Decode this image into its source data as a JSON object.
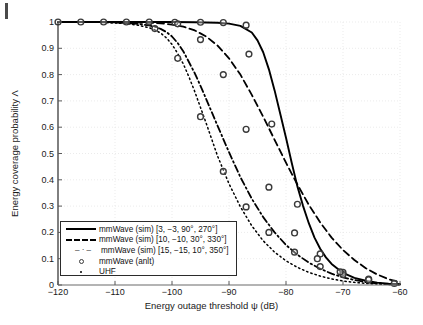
{
  "figure": {
    "background_color": "#ffffff",
    "artifact_note": "scan-mark"
  },
  "chart_data": {
    "type": "line",
    "title": "",
    "xlabel": "Energy outage threshold ψ (dB)",
    "ylabel": "Energy coverage probability Λ",
    "xlim": [
      -120,
      -60
    ],
    "ylim": [
      0,
      1
    ],
    "xticks": [
      -120,
      -110,
      -100,
      -90,
      -80,
      -70,
      -60
    ],
    "xticklabels": [
      "−120",
      "−110",
      "−100",
      "−90",
      "−80",
      "−70",
      "−60"
    ],
    "yticks": [
      0,
      0.1,
      0.2,
      0.3,
      0.4,
      0.5,
      0.6,
      0.7,
      0.8,
      0.9,
      1
    ],
    "yticklabels": [
      "0",
      "0.1",
      "0.2",
      "0.3",
      "0.4",
      "0.5",
      "0.6",
      "0.7",
      "0.8",
      "0.9",
      "1"
    ],
    "grid": true,
    "grid_style": "dotted",
    "grid_color": "#e6e6e6",
    "legend_position": "lower-left",
    "series": [
      {
        "name": "mmWave (sim) [3, −3, 90°, 270°]",
        "style": "solid",
        "color": "#000000",
        "x": [
          -120,
          -116,
          -112,
          -108,
          -104,
          -100,
          -96,
          -92,
          -90,
          -88,
          -86,
          -85,
          -84,
          -83,
          -82,
          -81,
          -80,
          -79,
          -78,
          -77,
          -76,
          -75,
          -74,
          -73,
          -72,
          -70,
          -68,
          -66,
          -64,
          -62,
          -60
        ],
        "y": [
          1,
          1,
          1,
          1,
          1,
          1,
          0.999,
          0.997,
          0.994,
          0.985,
          0.96,
          0.93,
          0.885,
          0.82,
          0.74,
          0.65,
          0.56,
          0.465,
          0.375,
          0.3,
          0.235,
          0.18,
          0.138,
          0.105,
          0.08,
          0.046,
          0.027,
          0.016,
          0.009,
          0.005,
          0.003
        ]
      },
      {
        "name": "mmWave (sim) [10, −10, 30°, 330°]",
        "style": "dashed",
        "color": "#000000",
        "x": [
          -120,
          -116,
          -112,
          -108,
          -104,
          -102,
          -100,
          -98,
          -96,
          -94,
          -92,
          -90,
          -88,
          -86,
          -84,
          -82,
          -80,
          -78,
          -76,
          -74,
          -72,
          -70,
          -68,
          -66,
          -64,
          -62,
          -60
        ],
        "y": [
          1,
          1,
          1,
          0.999,
          0.997,
          0.995,
          0.99,
          0.982,
          0.968,
          0.945,
          0.91,
          0.862,
          0.8,
          0.723,
          0.64,
          0.552,
          0.465,
          0.382,
          0.305,
          0.238,
          0.18,
          0.133,
          0.095,
          0.064,
          0.04,
          0.022,
          0.01
        ]
      },
      {
        "name": "mmWave (sim) [15, −15, 10°, 350°]",
        "style": "dash-dot",
        "color": "#000000",
        "x": [
          -120,
          -116,
          -112,
          -108,
          -106,
          -104,
          -103,
          -102,
          -101,
          -100,
          -99,
          -98,
          -96,
          -95,
          -94,
          -92,
          -91,
          -90,
          -88,
          -86,
          -84,
          -82,
          -80,
          -78,
          -76,
          -74,
          -72,
          -70,
          -68,
          -66,
          -64,
          -62,
          -60
        ],
        "y": [
          1,
          1,
          0.999,
          0.996,
          0.993,
          0.987,
          0.982,
          0.974,
          0.962,
          0.945,
          0.92,
          0.888,
          0.805,
          0.757,
          0.707,
          0.605,
          0.555,
          0.505,
          0.41,
          0.328,
          0.258,
          0.2,
          0.152,
          0.115,
          0.085,
          0.062,
          0.043,
          0.029,
          0.019,
          0.011,
          0.006,
          0.003,
          0.002
        ]
      },
      {
        "name": "UHF",
        "style": "dotted",
        "color": "#000000",
        "x": [
          -120,
          -116,
          -112,
          -108,
          -106,
          -104,
          -103,
          -102,
          -101,
          -100,
          -99,
          -98,
          -97,
          -96,
          -95,
          -94,
          -92,
          -90,
          -88,
          -86,
          -84,
          -82,
          -80,
          -78,
          -76,
          -74,
          -72,
          -70,
          -68,
          -66,
          -64,
          -62,
          -60
        ],
        "y": [
          1,
          1,
          0.999,
          0.994,
          0.988,
          0.978,
          0.97,
          0.958,
          0.94,
          0.915,
          0.88,
          0.84,
          0.79,
          0.735,
          0.675,
          0.615,
          0.49,
          0.385,
          0.297,
          0.225,
          0.168,
          0.125,
          0.092,
          0.067,
          0.048,
          0.034,
          0.023,
          0.015,
          0.01,
          0.006,
          0.004,
          0.002,
          0.001
        ]
      },
      {
        "name": "mmWave (anlt)",
        "style": "markers",
        "marker": "circle-open",
        "color": "#3a3a3a",
        "points": [
          {
            "x": -120,
            "y": 1
          },
          {
            "x": -116,
            "y": 1
          },
          {
            "x": -112,
            "y": 1
          },
          {
            "x": -108,
            "y": 1
          },
          {
            "x": -104,
            "y": 1
          },
          {
            "x": -99.5,
            "y": 0.999
          },
          {
            "x": -95,
            "y": 0.999
          },
          {
            "x": -91,
            "y": 0.998
          },
          {
            "x": -87,
            "y": 0.988
          },
          {
            "x": -86.5,
            "y": 0.878
          },
          {
            "x": -82.5,
            "y": 0.612
          },
          {
            "x": -78,
            "y": 0.307
          },
          {
            "x": -74,
            "y": 0.118
          },
          {
            "x": -70,
            "y": 0.048
          },
          {
            "x": -65.5,
            "y": 0.022
          },
          {
            "x": -103,
            "y": 0.975
          },
          {
            "x": -99,
            "y": 0.862
          },
          {
            "x": -95,
            "y": 0.64
          },
          {
            "x": -91,
            "y": 0.432
          },
          {
            "x": -87,
            "y": 0.297
          },
          {
            "x": -83,
            "y": 0.2
          },
          {
            "x": -78.5,
            "y": 0.125
          },
          {
            "x": -74,
            "y": 0.07
          },
          {
            "x": -70,
            "y": 0.04
          },
          {
            "x": -99,
            "y": 0.993
          },
          {
            "x": -95,
            "y": 0.933
          },
          {
            "x": -91,
            "y": 0.8
          },
          {
            "x": -87,
            "y": 0.592
          },
          {
            "x": -83,
            "y": 0.372
          },
          {
            "x": -78.5,
            "y": 0.198
          },
          {
            "x": -74.5,
            "y": 0.1
          },
          {
            "x": -70.5,
            "y": 0.05
          },
          {
            "x": -65.5,
            "y": 0.02
          },
          {
            "x": -61,
            "y": 0.006
          }
        ]
      }
    ],
    "legend_entries": [
      {
        "label": "mmWave (sim) [3, −3, 90°, 270°]",
        "style": "solid"
      },
      {
        "label": "mmWave (sim) [10, −10, 30°, 330°]",
        "style": "dashed"
      },
      {
        "label": "mmWave (sim) [15, −15, 10°, 350°]",
        "style": "dash-dot"
      },
      {
        "label": "mmWave (anlt)",
        "style": "circle-marker"
      },
      {
        "label": "UHF",
        "style": "dot-marker"
      }
    ],
    "legend_dashdot_glyph": "– · –"
  }
}
